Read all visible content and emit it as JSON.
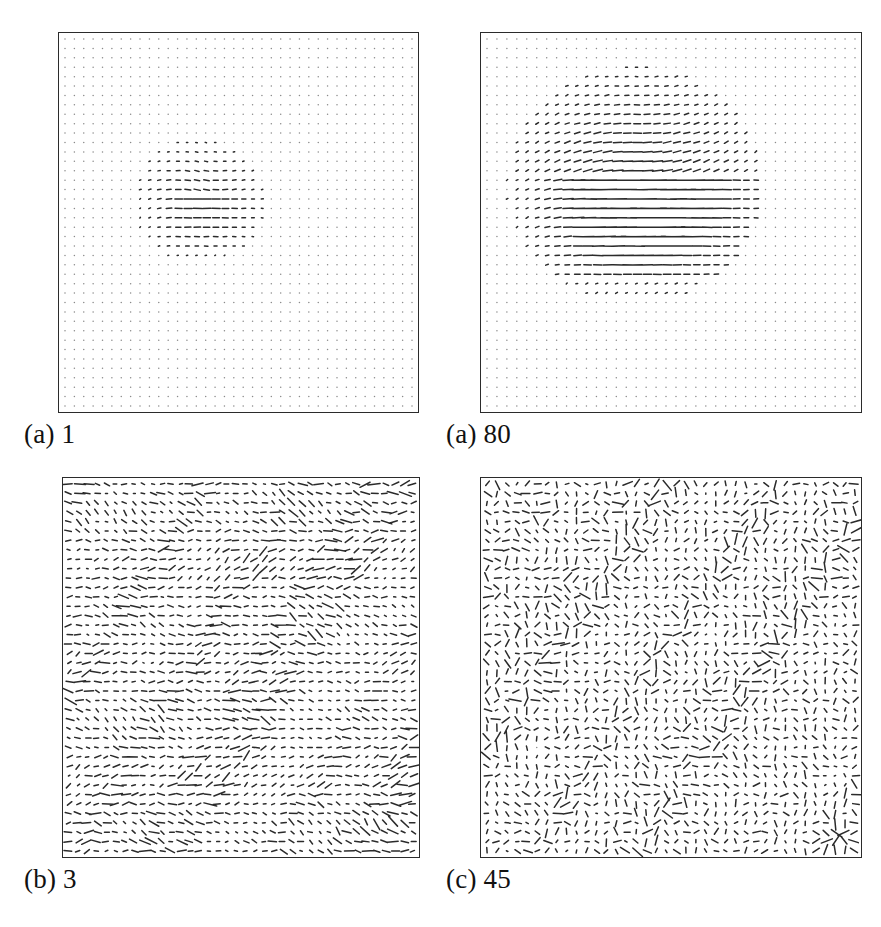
{
  "figure": {
    "width": 881,
    "height": 927,
    "background": "#ffffff",
    "ink_color": "#2b2b2b",
    "frame_color": "#2b2b2b",
    "label_color": "#111111",
    "type": "quiver-field-grid",
    "panel_count": 4
  },
  "chart_data": {
    "type": "scatter",
    "title": "",
    "subtitle": "",
    "xlabel": "",
    "ylabel": "",
    "grid": false,
    "legend_position": "none",
    "plot_kind": "vector-field-quiver",
    "layout": {
      "rows": 2,
      "cols": 2
    },
    "shared_grid": {
      "nx": 38,
      "ny": 40,
      "marker": "dot",
      "dot_radius": 0.75,
      "dot_color": "#8a8a8a",
      "vector_color": "#2b2b2b",
      "vector_line_width": 1.5
    },
    "panels": [
      {
        "id": "panel-a-1",
        "label": "(a) 1",
        "label_prefix": "(a)",
        "label_value": "1",
        "position": {
          "x": 58,
          "y": 32,
          "width": 361,
          "height": 381
        },
        "label_position": {
          "x": 24,
          "y": 421
        },
        "regime": "localized-seed",
        "description": "Sparse near-zero field with a small localized vortex-shear patch near the centre",
        "field": {
          "mode": "localized",
          "seed": 17,
          "base_amplitude": 0.05,
          "blob": {
            "cx": 0.385,
            "cy": 0.44,
            "rx": 0.165,
            "ry": 0.145,
            "amplitude": 1.0,
            "shear_strength": 1.15,
            "rotation": -0.35
          },
          "max_vector_length": 9.5,
          "noise": 0.03
        }
      },
      {
        "id": "panel-a-80",
        "label": "(a) 80",
        "label_prefix": "(a)",
        "label_value": "80",
        "position": {
          "x": 480,
          "y": 32,
          "width": 382,
          "height": 381
        },
        "label_position": {
          "x": 446,
          "y": 421
        },
        "regime": "grown-seed",
        "description": "Sparse field with a large developed shear structure: diagonal fan above, long horizontal streaks below",
        "field": {
          "mode": "localized",
          "seed": 80,
          "base_amplitude": 0.05,
          "blob": {
            "cx": 0.4,
            "cy": 0.4,
            "rx": 0.3,
            "ry": 0.28,
            "amplitude": 1.0,
            "shear_strength": 1.6,
            "rotation": -0.55
          },
          "max_vector_length": 16.0,
          "noise": 0.03
        }
      },
      {
        "id": "panel-b-3",
        "label": "(b) 3",
        "label_prefix": "(b)",
        "label_value": "3",
        "position": {
          "x": 62,
          "y": 477,
          "width": 358,
          "height": 381
        },
        "label_position": {
          "x": 24,
          "y": 866
        },
        "regime": "turbulent-streamwise",
        "description": "Fully populated turbulent field, vectors predominantly horizontal (streamwise) with banded streaks",
        "field": {
          "mode": "turbulent",
          "seed": 3,
          "base_amplitude": 1.0,
          "anisotropy": 0.8,
          "band_count": 7,
          "max_vector_length": 13.0,
          "noise": 0.55
        }
      },
      {
        "id": "panel-c-45",
        "label": "(c) 45",
        "label_prefix": "(c)",
        "label_value": "45",
        "position": {
          "x": 480,
          "y": 477,
          "width": 382,
          "height": 381
        },
        "label_position": {
          "x": 446,
          "y": 866
        },
        "regime": "turbulent-isotropic",
        "description": "Fully populated turbulent field with more isotropic, swirling orientation and a converging burst at the lower-right corner",
        "field": {
          "mode": "turbulent",
          "seed": 45,
          "base_amplitude": 1.0,
          "anisotropy": 0.18,
          "band_count": 4,
          "max_vector_length": 13.0,
          "noise": 0.7,
          "corner_burst": {
            "cx": 0.955,
            "cy": 0.955,
            "strength": 1.0
          }
        }
      }
    ]
  }
}
